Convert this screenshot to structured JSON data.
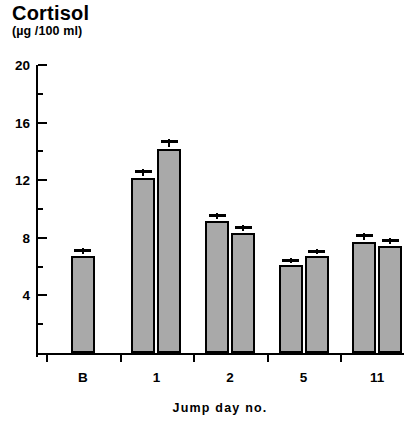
{
  "chart_data": {
    "type": "bar",
    "title": "Cortisol",
    "subtitle": "(µg /100 ml)",
    "ylabel": "Cortisol (µg/100 ml)",
    "xlabel": "Jump day no.",
    "ylim": [
      0,
      20
    ],
    "yticks": [
      4,
      8,
      12,
      16,
      20
    ],
    "ytick_labels": [
      "4",
      "8",
      "12",
      "16",
      "20"
    ],
    "yminor_ticks": [
      2,
      6,
      10,
      14,
      18
    ],
    "grid": false,
    "legend": "none",
    "categories": [
      "B",
      "1",
      "2",
      "5",
      "11"
    ],
    "series": [
      {
        "name": "measurement 1",
        "values": [
          6.6,
          12.0,
          9.0,
          6.0,
          7.6
        ],
        "errors": [
          0.4,
          0.5,
          0.45,
          0.35,
          0.45
        ]
      },
      {
        "name": "measurement 2",
        "values": [
          null,
          14.0,
          8.2,
          6.6,
          7.3
        ],
        "errors": [
          null,
          0.6,
          0.4,
          0.35,
          0.4
        ]
      }
    ],
    "bars": [
      {
        "group": "B",
        "index": 0,
        "value": 6.6,
        "error": 0.4
      },
      {
        "group": "1",
        "index": 0,
        "value": 12.0,
        "error": 0.5
      },
      {
        "group": "1",
        "index": 1,
        "value": 14.0,
        "error": 0.6
      },
      {
        "group": "2",
        "index": 0,
        "value": 9.0,
        "error": 0.45
      },
      {
        "group": "2",
        "index": 1,
        "value": 8.2,
        "error": 0.4
      },
      {
        "group": "5",
        "index": 0,
        "value": 6.0,
        "error": 0.35
      },
      {
        "group": "5",
        "index": 1,
        "value": 6.6,
        "error": 0.35
      },
      {
        "group": "11",
        "index": 0,
        "value": 7.6,
        "error": 0.45
      },
      {
        "group": "11",
        "index": 1,
        "value": 7.3,
        "error": 0.4
      }
    ],
    "colors": {
      "bar_fill": "#a9a9a9",
      "bar_edge": "#000000",
      "axis": "#000000",
      "background": "#ffffff"
    }
  }
}
